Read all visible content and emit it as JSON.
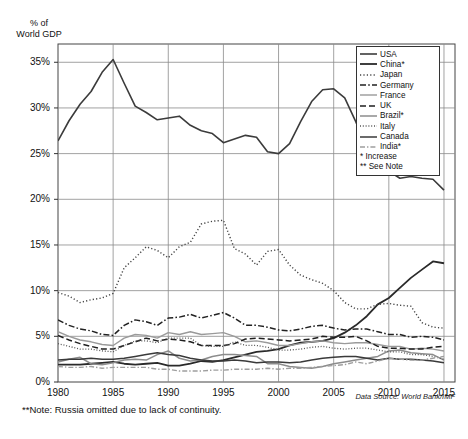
{
  "chart_data": {
    "type": "line",
    "title": "",
    "ylabel": "% of\nWorld GDP",
    "xlabel": "",
    "ylim": [
      0,
      37
    ],
    "xlim": [
      1980,
      2016
    ],
    "yticks": [
      0,
      5,
      10,
      15,
      20,
      25,
      30,
      35
    ],
    "ytick_labels": [
      "0%",
      "5%",
      "10%",
      "15%",
      "20%",
      "25%",
      "30%",
      "35%"
    ],
    "xticks": [
      1980,
      1985,
      1990,
      1995,
      2000,
      2005,
      2010,
      2015
    ],
    "xtick_labels": [
      "1980",
      "1985",
      "1990",
      "1995",
      "2000",
      "2005",
      "2010",
      "2015"
    ],
    "grid": true,
    "legend_position": "top-right",
    "x": [
      1980,
      1981,
      1982,
      1983,
      1984,
      1985,
      1986,
      1987,
      1988,
      1989,
      1990,
      1991,
      1992,
      1993,
      1994,
      1995,
      1996,
      1997,
      1998,
      1999,
      2000,
      2001,
      2002,
      2003,
      2004,
      2005,
      2006,
      2007,
      2008,
      2009,
      2010,
      2011,
      2012,
      2013,
      2014,
      2015
    ],
    "series": [
      {
        "name": "USA",
        "style": "solid",
        "color": "#3b3b3b",
        "width": 1.6,
        "values": [
          26.4,
          28.6,
          30.4,
          31.8,
          33.9,
          35.3,
          32.7,
          30.2,
          29.5,
          28.7,
          28.9,
          29.1,
          28.1,
          27.5,
          27.2,
          26.2,
          26.6,
          27.0,
          26.8,
          25.2,
          25.0,
          26.1,
          28.5,
          30.7,
          32.0,
          32.1,
          31.1,
          28.5,
          25.6,
          24.2,
          23.1,
          22.3,
          22.5,
          22.3,
          22.2,
          21.0
        ]
      },
      {
        "name": "China*",
        "style": "solid-thick",
        "color": "#2a2a2a",
        "width": 1.8,
        "values": [
          1.9,
          1.9,
          1.9,
          2.0,
          2.1,
          2.2,
          2.0,
          1.9,
          2.0,
          2.1,
          1.8,
          1.8,
          2.0,
          2.3,
          2.2,
          2.4,
          2.7,
          3.0,
          3.3,
          3.4,
          3.6,
          4.0,
          4.3,
          4.4,
          4.5,
          4.8,
          5.4,
          6.2,
          7.2,
          8.5,
          9.2,
          10.3,
          11.4,
          12.3,
          13.2,
          13.0
        ]
      },
      {
        "name": "Japan",
        "style": "dotted",
        "color": "#444444",
        "width": 1.4,
        "values": [
          9.8,
          9.4,
          8.7,
          9.0,
          9.2,
          9.7,
          12.5,
          13.6,
          14.8,
          14.4,
          13.6,
          14.8,
          15.3,
          17.3,
          17.6,
          17.7,
          14.6,
          14.0,
          12.8,
          14.3,
          14.5,
          12.8,
          11.7,
          11.2,
          10.8,
          10.0,
          8.7,
          8.0,
          8.0,
          8.5,
          8.6,
          8.4,
          8.3,
          6.5,
          6.0,
          5.9
        ]
      },
      {
        "name": "Germany",
        "style": "dashdot",
        "color": "#222222",
        "width": 1.5,
        "values": [
          6.8,
          6.2,
          5.8,
          5.6,
          5.2,
          5.1,
          6.2,
          6.8,
          6.6,
          6.2,
          7.0,
          7.1,
          7.4,
          7.0,
          7.3,
          7.6,
          7.0,
          6.2,
          6.2,
          6.0,
          5.7,
          5.6,
          5.8,
          6.1,
          6.2,
          5.9,
          5.7,
          5.8,
          5.8,
          5.5,
          5.2,
          5.2,
          4.9,
          5.0,
          4.9,
          4.6
        ]
      },
      {
        "name": "France",
        "style": "solid-light",
        "color": "#9a9a9a",
        "width": 1.4,
        "values": [
          5.5,
          5.0,
          4.6,
          4.4,
          4.1,
          4.0,
          4.8,
          5.2,
          5.1,
          4.8,
          5.4,
          5.2,
          5.5,
          5.2,
          5.3,
          5.4,
          5.0,
          4.4,
          4.5,
          4.3,
          4.0,
          4.0,
          4.2,
          4.4,
          4.5,
          4.3,
          4.2,
          4.3,
          4.3,
          4.1,
          3.9,
          3.9,
          3.6,
          3.7,
          3.6,
          3.4
        ]
      },
      {
        "name": "UK",
        "style": "dash",
        "color": "#1f1f1f",
        "width": 1.5,
        "values": [
          5.1,
          4.6,
          4.2,
          3.9,
          3.6,
          3.6,
          4.0,
          4.4,
          4.8,
          4.5,
          4.7,
          4.6,
          4.4,
          4.0,
          4.0,
          4.0,
          4.2,
          4.7,
          4.8,
          4.7,
          4.6,
          4.5,
          4.6,
          4.7,
          5.0,
          4.9,
          4.9,
          5.0,
          4.5,
          3.9,
          3.7,
          3.7,
          3.6,
          3.6,
          3.8,
          3.9
        ]
      },
      {
        "name": "Brazil*",
        "style": "solid-mid",
        "color": "#8c8c8c",
        "width": 1.5,
        "values": [
          2.2,
          2.5,
          2.7,
          2.0,
          1.9,
          2.1,
          2.4,
          2.5,
          2.4,
          3.0,
          3.4,
          2.6,
          2.3,
          2.4,
          2.8,
          3.0,
          3.0,
          2.9,
          2.8,
          2.0,
          2.0,
          1.7,
          1.6,
          1.5,
          1.7,
          2.0,
          2.2,
          2.4,
          2.6,
          2.8,
          3.4,
          3.5,
          3.2,
          3.1,
          3.0,
          2.4
        ]
      },
      {
        "name": "Italy",
        "style": "fine-dotted",
        "color": "#555555",
        "width": 1.3,
        "values": [
          4.2,
          3.9,
          3.6,
          3.6,
          3.4,
          3.3,
          4.0,
          4.5,
          4.5,
          4.3,
          4.8,
          4.8,
          4.8,
          4.0,
          3.9,
          3.9,
          4.4,
          4.0,
          4.0,
          3.8,
          3.5,
          3.5,
          3.6,
          3.8,
          3.9,
          3.7,
          3.6,
          3.7,
          3.7,
          3.5,
          3.3,
          3.3,
          3.0,
          3.0,
          2.8,
          2.5
        ]
      },
      {
        "name": "Canada",
        "style": "solid-dark",
        "color": "#3a3a3a",
        "width": 1.5,
        "values": [
          2.4,
          2.5,
          2.5,
          2.6,
          2.5,
          2.5,
          2.6,
          2.8,
          3.0,
          3.2,
          3.0,
          2.9,
          2.6,
          2.4,
          2.3,
          2.3,
          2.4,
          2.3,
          2.1,
          2.2,
          2.2,
          2.1,
          2.2,
          2.4,
          2.6,
          2.7,
          2.8,
          2.8,
          2.6,
          2.4,
          2.6,
          2.5,
          2.5,
          2.4,
          2.3,
          2.1
        ]
      },
      {
        "name": "India*",
        "style": "dashdot-light",
        "color": "#9e9e9e",
        "width": 1.4,
        "values": [
          1.7,
          1.6,
          1.6,
          1.7,
          1.5,
          1.6,
          1.6,
          1.6,
          1.6,
          1.4,
          1.4,
          1.2,
          1.2,
          1.2,
          1.3,
          1.3,
          1.4,
          1.4,
          1.4,
          1.5,
          1.4,
          1.5,
          1.5,
          1.6,
          1.7,
          1.8,
          1.9,
          2.2,
          2.0,
          2.3,
          2.6,
          2.5,
          2.4,
          2.4,
          2.6,
          2.8
        ]
      }
    ],
    "legend_notes": [
      "* Increase",
      "** See Note"
    ],
    "footnote": "**Note: Russia omitted due to lack of continuity.",
    "source": "Data Source: World Bank/IMF"
  }
}
